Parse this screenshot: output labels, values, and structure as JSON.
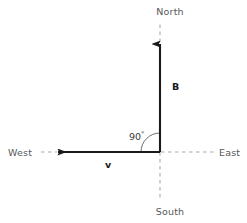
{
  "figure": {
    "background_color": "#ffffff",
    "width": 247,
    "height": 223
  },
  "colors": {
    "solid_vector": "#1a1a1a",
    "dashed_axis": "#a9a9ab",
    "compass_text": "#58585a",
    "vector_text": "#1a1a1a",
    "angle_text": "#3a3a3c",
    "arc": "#6b6b6d"
  },
  "origin": {
    "x": 160,
    "y": 152
  },
  "compass": {
    "north": {
      "label": "North",
      "x": 170,
      "y": 15,
      "anchor": "middle"
    },
    "south": {
      "label": "South",
      "x": 170,
      "y": 215,
      "anchor": "middle"
    },
    "east": {
      "label": "East",
      "x": 219,
      "y": 156,
      "anchor": "start"
    },
    "west": {
      "label": "West",
      "x": 8,
      "y": 156,
      "anchor": "start"
    }
  },
  "vectors": [
    {
      "name": "magnetic-field",
      "label": "B",
      "direction": "north",
      "label_x": 172,
      "label_y": 90,
      "tail_x": 160,
      "tail_y": 152,
      "head_x": 160,
      "head_y": 42
    },
    {
      "name": "velocity",
      "label": "v",
      "direction": "west",
      "label_x": 108,
      "label_y": 168,
      "tail_x": 160,
      "tail_y": 152,
      "head_x": 56,
      "head_y": 152
    }
  ],
  "angle": {
    "value": "90",
    "unit": "°",
    "full_label": "90°",
    "label_x": 129,
    "label_y": 140,
    "arc_radius": 19,
    "between": [
      "velocity",
      "magnetic-field"
    ]
  },
  "dashed_axes": [
    {
      "name": "north-axis-dashed",
      "x1": 160,
      "y1": 42,
      "x2": 160,
      "y2": 22
    },
    {
      "name": "south-axis-dashed",
      "x1": 160,
      "y1": 152,
      "x2": 160,
      "y2": 200
    },
    {
      "name": "east-axis-dashed",
      "x1": 160,
      "y1": 152,
      "x2": 214,
      "y2": 152
    },
    {
      "name": "west-axis-dashed",
      "x1": 56,
      "y1": 152,
      "x2": 41,
      "y2": 152
    }
  ]
}
